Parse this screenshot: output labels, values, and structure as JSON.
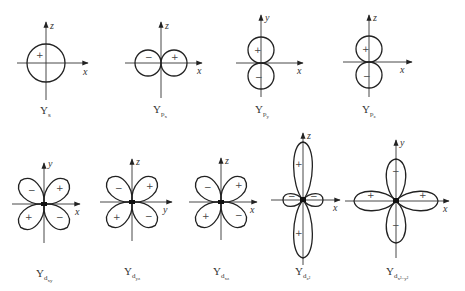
{
  "figure": {
    "panels": [
      {
        "id": "s",
        "label_main": "Y",
        "label_sub": "s",
        "label_subsub": "",
        "axes": {
          "h": "x",
          "v": "z"
        },
        "signs": [
          "+"
        ]
      },
      {
        "id": "px",
        "label_main": "Y",
        "label_sub": "p",
        "label_subsub": "x",
        "axes": {
          "h": "x",
          "v": "z"
        },
        "signs": [
          "−",
          "+"
        ]
      },
      {
        "id": "py",
        "label_main": "Y",
        "label_sub": "p",
        "label_subsub": "y",
        "axes": {
          "h": "x",
          "v": "y"
        },
        "signs": [
          "+",
          "−"
        ]
      },
      {
        "id": "pz",
        "label_main": "Y",
        "label_sub": "p",
        "label_subsub": "z",
        "axes": {
          "h": "x",
          "v": "z"
        },
        "signs": [
          "+",
          "−"
        ]
      },
      {
        "id": "dxy",
        "label_main": "Y",
        "label_sub": "d",
        "label_subsub": "xy",
        "axes": {
          "h": "x",
          "v": "y"
        },
        "signs": [
          "−",
          "+",
          "+",
          "−"
        ]
      },
      {
        "id": "dyz",
        "label_main": "Y",
        "label_sub": "d",
        "label_subsub": "yz",
        "axes": {
          "h": "y",
          "v": "z"
        },
        "signs": [
          "−",
          "+",
          "+",
          "−"
        ]
      },
      {
        "id": "dxz",
        "label_main": "Y",
        "label_sub": "d",
        "label_subsub": "xz",
        "axes": {
          "h": "x",
          "v": "z"
        },
        "signs": [
          "−",
          "+",
          "+",
          "−"
        ]
      },
      {
        "id": "dz2",
        "label_main": "Y",
        "label_sub": "d",
        "label_subsub": "z²",
        "axes": {
          "h": "x",
          "v": "z"
        },
        "signs": [
          "+",
          "−",
          "−",
          "+"
        ]
      },
      {
        "id": "dx2y2",
        "label_main": "Y",
        "label_sub": "d",
        "label_subsub": "x²−y²",
        "axes": {
          "h": "x",
          "v": "y"
        },
        "signs": [
          "−",
          "+",
          "+",
          "−"
        ]
      }
    ]
  }
}
